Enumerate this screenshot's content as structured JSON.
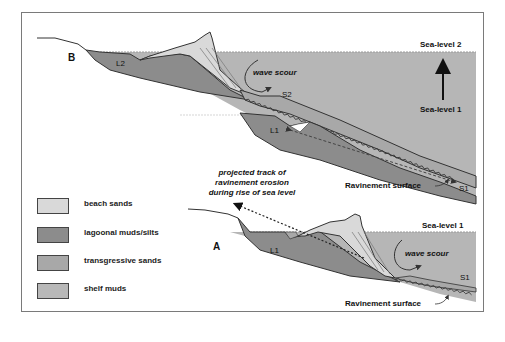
{
  "figure": {
    "panels": [
      {
        "id": "B",
        "label": "B",
        "lagoon_label": "L2",
        "shelf_label_upper": "S2",
        "old_lagoon_label": "L1",
        "old_shelf_label": "S1",
        "annotation_wave": "wave scour",
        "sea_level_top": "Sea-level 2",
        "sea_level_bottom": "Sea-level 1",
        "surface_label": "Ravinement surface"
      },
      {
        "id": "A",
        "label": "A",
        "lagoon_label": "L1",
        "shelf_label": "S1",
        "annotation_wave": "wave scour",
        "sea_level": "Sea-level 1",
        "surface_label": "Ravinement surface"
      }
    ],
    "projected_track": {
      "line1": "projected track of",
      "line2": "ravinement erosion",
      "line3": "during rise of sea level"
    }
  },
  "legend": {
    "items": [
      {
        "label": "beach sands",
        "color": "#d9d9d9"
      },
      {
        "label": "lagoonal muds/silts",
        "color": "#8c8c8c"
      },
      {
        "label": "transgressive sands",
        "color": "#a8a8a8"
      },
      {
        "label": "shelf muds",
        "color": "#b8b8b8"
      }
    ]
  },
  "colors": {
    "sea": "#b6b6b6",
    "beach": "#d9d9d9",
    "lagoon": "#8c8c8c",
    "transgressive": "#a8a8a8",
    "outline": "#333333"
  }
}
